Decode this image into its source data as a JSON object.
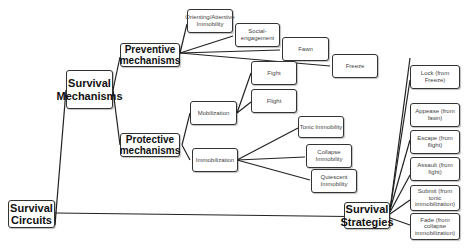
{
  "diagram": {
    "type": "mind-map",
    "nodes": {
      "survival_circuits": "Survival Circuits",
      "survival_mechanisms": "Survival Mechanisms",
      "preventive": "Preventive mechanisms",
      "protective": "Protective mechanisms",
      "orienting": "Orienting/Attentive Immobility",
      "social": "Social-engagement",
      "fawn": "Fawn",
      "freeze": "Freeze",
      "mobilization": "Mobilization",
      "fight": "Fight",
      "flight": "Flight",
      "immobilization": "Immobilization",
      "tonic": "Tonic Immobility",
      "collapse": "Collapse Immobility",
      "quiescent": "Quiescent Immobility",
      "survival_strategies": "Survival Strategies",
      "lock": "Lock (from Freeze)",
      "appease": "Appease (from fawn)",
      "escape": "Escape (from flight)",
      "assault": "Assault (from fight)",
      "submit": "Submit (from tonic immobilization)",
      "fade": "Fade (from collapse immobilization)"
    },
    "edges": [
      [
        "survival_circuits",
        "survival_mechanisms"
      ],
      [
        "survival_circuits",
        "survival_strategies"
      ],
      [
        "survival_mechanisms",
        "preventive"
      ],
      [
        "survival_mechanisms",
        "protective"
      ],
      [
        "preventive",
        "orienting"
      ],
      [
        "preventive",
        "social"
      ],
      [
        "preventive",
        "fawn"
      ],
      [
        "preventive",
        "freeze"
      ],
      [
        "protective",
        "mobilization"
      ],
      [
        "protective",
        "immobilization"
      ],
      [
        "mobilization",
        "fight"
      ],
      [
        "mobilization",
        "flight"
      ],
      [
        "immobilization",
        "tonic"
      ],
      [
        "immobilization",
        "collapse"
      ],
      [
        "immobilization",
        "quiescent"
      ],
      [
        "survival_strategies",
        "lock"
      ],
      [
        "survival_strategies",
        "appease"
      ],
      [
        "survival_strategies",
        "escape"
      ],
      [
        "survival_strategies",
        "assault"
      ],
      [
        "survival_strategies",
        "submit"
      ],
      [
        "survival_strategies",
        "fade"
      ]
    ]
  }
}
